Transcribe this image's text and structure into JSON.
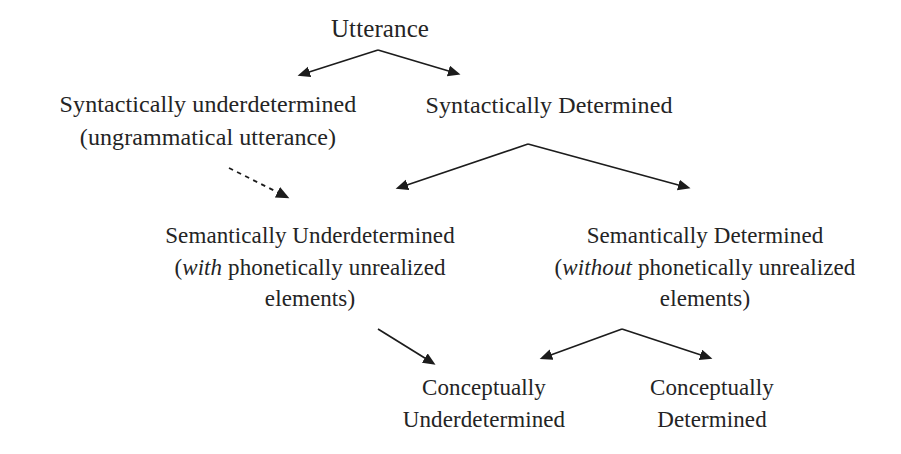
{
  "diagram": {
    "background_color": "#ffffff",
    "text_color": "#242424",
    "line_color": "#1c1c1c",
    "nodes": {
      "utterance": {
        "label": "Utterance",
        "lines": [
          "Utterance"
        ]
      },
      "syntactically_underdetermined": {
        "label": "Syntactically underdetermined (ungrammatical utterance)",
        "line1": "Syntactically underdetermined",
        "line2": "(ungrammatical utterance)"
      },
      "syntactically_determined": {
        "label": "Syntactically Determined",
        "line1": "Syntactically Determined"
      },
      "semantically_underdetermined": {
        "label": "Semantically Underdetermined (with phonetically unrealized elements)",
        "line1": "Semantically Underdetermined",
        "line2_open": "(",
        "line2_italic": "with",
        "line2_rest": " phonetically unrealized",
        "line3": "elements)"
      },
      "semantically_determined": {
        "label": "Semantically Determined (without phonetically unrealized elements)",
        "line1": "Semantically Determined",
        "line2_open": "(",
        "line2_italic": "without",
        "line2_rest": " phonetically unrealized",
        "line3": "elements)"
      },
      "conceptually_underdetermined": {
        "label": "Conceptually Underdetermined",
        "line1": "Conceptually",
        "line2": "Underdetermined"
      },
      "conceptually_determined": {
        "label": "Conceptually Determined",
        "line1": "Conceptually",
        "line2": "Determined"
      }
    },
    "edges": [
      {
        "id": "utterance-to-syntactically-underdetermined",
        "from": "utterance",
        "to": "syntactically_underdetermined",
        "style": "solid",
        "arrowhead": true
      },
      {
        "id": "utterance-to-syntactically-determined",
        "from": "utterance",
        "to": "syntactically_determined",
        "style": "solid",
        "arrowhead": true
      },
      {
        "id": "syntactically-underdetermined-to-semantically-underdetermined",
        "from": "syntactically_underdetermined",
        "to": "semantically_underdetermined",
        "style": "dashed",
        "arrowhead": true
      },
      {
        "id": "syntactically-determined-to-semantically-underdetermined",
        "from": "syntactically_determined",
        "to": "semantically_underdetermined",
        "style": "solid",
        "arrowhead": true
      },
      {
        "id": "syntactically-determined-to-semantically-determined",
        "from": "syntactically_determined",
        "to": "semantically_determined",
        "style": "solid",
        "arrowhead": true
      },
      {
        "id": "semantically-underdetermined-to-conceptually-underdetermined",
        "from": "semantically_underdetermined",
        "to": "conceptually_underdetermined",
        "style": "solid",
        "arrowhead": true
      },
      {
        "id": "semantically-determined-to-conceptually-underdetermined",
        "from": "semantically_determined",
        "to": "conceptually_underdetermined",
        "style": "solid",
        "arrowhead": true
      },
      {
        "id": "semantically-determined-to-conceptually-determined",
        "from": "semantically_determined",
        "to": "conceptually_determined",
        "style": "solid",
        "arrowhead": true
      }
    ]
  }
}
